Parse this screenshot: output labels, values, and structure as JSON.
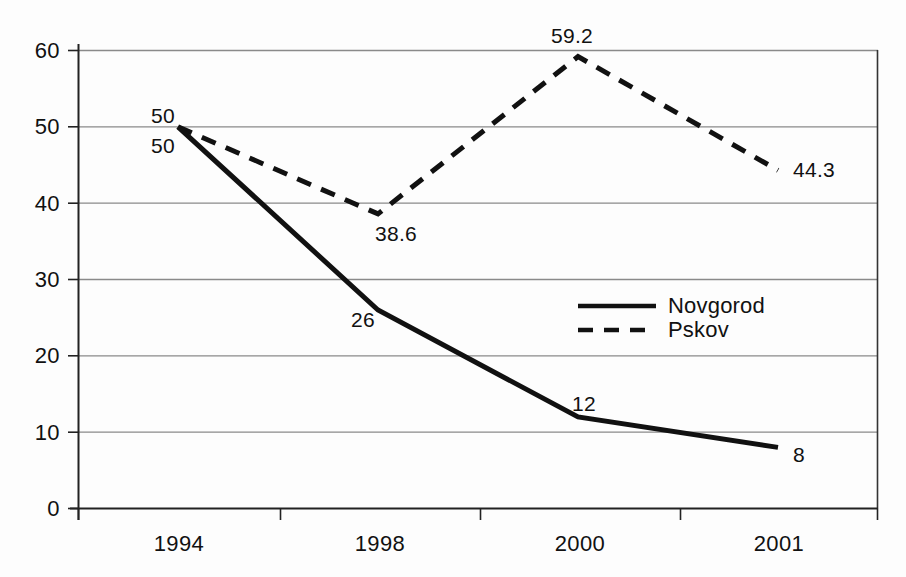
{
  "chart_data": {
    "type": "line",
    "title": "",
    "subtitle": "",
    "xlabel": "",
    "ylabel": "",
    "categories": [
      "1994",
      "1998",
      "2000",
      "2001"
    ],
    "ylim": [
      0,
      60
    ],
    "ytick_step": 10,
    "yticks": [
      "60",
      "50",
      "40",
      "30",
      "20",
      "10",
      "0"
    ],
    "grid": true,
    "grid_axis": "y",
    "legend_position": "center-right-inside",
    "series": [
      {
        "name": "Novgorod",
        "style": "solid",
        "color": "#111111",
        "values": [
          50,
          26,
          12,
          8
        ],
        "labels": [
          "50",
          "26",
          "12",
          "8"
        ]
      },
      {
        "name": "Pskov",
        "style": "dashed",
        "color": "#111111",
        "values": [
          50,
          38.6,
          59.2,
          44.3
        ],
        "labels": [
          "50",
          "38.6",
          "59.2",
          "44.3"
        ]
      }
    ]
  },
  "axes": {
    "y_ticks": [
      {
        "text": "60",
        "value": 60
      },
      {
        "text": "50",
        "value": 50
      },
      {
        "text": "40",
        "value": 40
      },
      {
        "text": "30",
        "value": 30
      },
      {
        "text": "20",
        "value": 20
      },
      {
        "text": "10",
        "value": 10
      },
      {
        "text": "0",
        "value": 0
      }
    ],
    "x_ticks": [
      {
        "text": "1994"
      },
      {
        "text": "1998"
      },
      {
        "text": "2000"
      },
      {
        "text": "2001"
      }
    ]
  },
  "legend": {
    "items": [
      {
        "label": "Novgorod",
        "style": "solid"
      },
      {
        "label": "Pskov",
        "style": "dashed"
      }
    ]
  },
  "data_labels": {
    "novgorod_1994": "50",
    "pskov_1994": "50",
    "pskov_1998": "38.6",
    "novgorod_1998": "26",
    "pskov_2000": "59.2",
    "novgorod_2000": "12",
    "pskov_2001": "44.3",
    "novgorod_2001": "8"
  },
  "colors": {
    "series_line": "#111111",
    "gridline": "#8a8a8a",
    "axis": "#222222",
    "background": "#fdfdfd",
    "text": "#111111"
  }
}
